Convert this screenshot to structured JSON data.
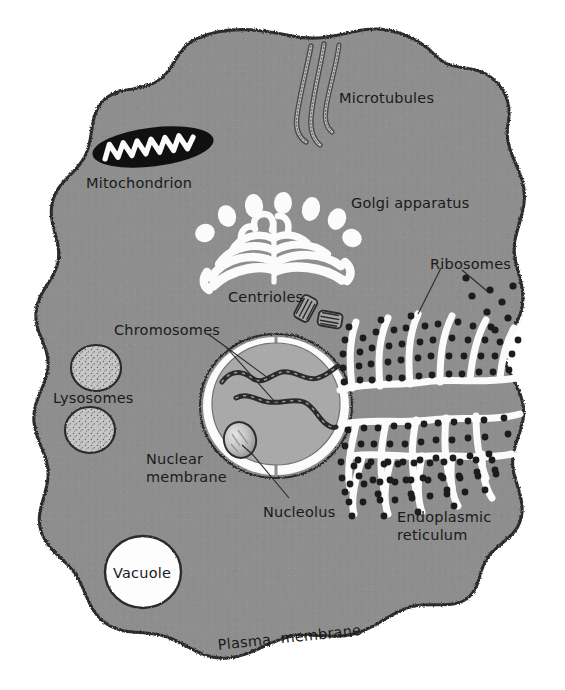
{
  "diagram": {
    "type": "labeled-biological-diagram",
    "canvas": {
      "width": 565,
      "height": 690
    },
    "colors": {
      "background": "#ffffff",
      "cytoplasm": "#8e8e8e",
      "cytoplasm_shade": "#9a9a9a",
      "membrane_outline": "#2b2b2b",
      "organelle_white": "#fbfbfb",
      "nucleoplasm": "#a9a9a9",
      "nucleolus": "#c8c8c8",
      "lysosome_fill": "#c4c4c4",
      "mitochondrion_fill": "#111111",
      "ribosome_dot": "#1c1c1c",
      "label_text": "#1a1a1a"
    },
    "labels": [
      {
        "id": "microtubules",
        "text": "Microtubules",
        "x": 339,
        "y": 90,
        "rotate": 0
      },
      {
        "id": "mitochondrion",
        "text": "Mitochondrion",
        "x": 86,
        "y": 175,
        "rotate": 0
      },
      {
        "id": "golgi",
        "text": "Golgi apparatus",
        "x": 351,
        "y": 195,
        "rotate": 0
      },
      {
        "id": "ribosomes",
        "text": "Ribosomes",
        "x": 430,
        "y": 256,
        "rotate": 0
      },
      {
        "id": "centrioles",
        "text": "Centrioles",
        "x": 228,
        "y": 289,
        "rotate": 0
      },
      {
        "id": "chromosomes",
        "text": "Chromosomes",
        "x": 114,
        "y": 322,
        "rotate": 0
      },
      {
        "id": "lysosomes",
        "text": "Lysosomes",
        "x": 53,
        "y": 390,
        "rotate": 0
      },
      {
        "id": "nuclear-membrane",
        "text": "Nuclear\nmembrane",
        "x": 146,
        "y": 450,
        "rotate": 0
      },
      {
        "id": "nucleolus",
        "text": "Nucleolus",
        "x": 263,
        "y": 504,
        "rotate": 0
      },
      {
        "id": "endoplasmic-reticulum",
        "text": "Endoplasmic\nreticulum",
        "x": 397,
        "y": 508,
        "rotate": 0
      },
      {
        "id": "vacuole",
        "text": "Vacuole",
        "x": 113,
        "y": 565,
        "rotate": 0
      },
      {
        "id": "plasma-membrane",
        "text": "Plasma  membrane",
        "x": 217,
        "y": 637,
        "rotate": -6
      }
    ],
    "organelles": [
      {
        "id": "plasma-membrane",
        "name": "Plasma membrane",
        "count": 1,
        "appearance": "irregular amoeboid outline with stippled dark border enclosing gray cytoplasm"
      },
      {
        "id": "cytoplasm",
        "name": "Cytoplasm",
        "count": 1,
        "appearance": "medium gray textured fill"
      },
      {
        "id": "mitochondrion",
        "name": "Mitochondrion",
        "count": 1,
        "appearance": "black elongated ellipse with white zigzag cristae"
      },
      {
        "id": "microtubules",
        "name": "Microtubules",
        "count": 3,
        "appearance": "three wavy vertical tubes, light fill with dark outline"
      },
      {
        "id": "golgi-apparatus",
        "name": "Golgi apparatus",
        "count": 1,
        "appearance": "white stacked curved cisternae with detached vesicles above"
      },
      {
        "id": "centrioles",
        "name": "Centrioles",
        "count": 2,
        "appearance": "two short striated cylinders at right angles"
      },
      {
        "id": "nucleus",
        "name": "Nucleus",
        "count": 1,
        "appearance": "large light gray sphere ringed by white nuclear membrane"
      },
      {
        "id": "nuclear-membrane",
        "name": "Nuclear membrane",
        "count": 1,
        "appearance": "white double-layer ring around the nucleus"
      },
      {
        "id": "nucleolus",
        "name": "Nucleolus",
        "count": 1,
        "appearance": "small light speckled sphere inside the nucleus"
      },
      {
        "id": "chromosomes",
        "name": "Chromosomes",
        "count": 2,
        "appearance": "two dark wavy threads inside the nucleus"
      },
      {
        "id": "endoplasmic-reticulum",
        "name": "Endoplasmic reticulum",
        "count": 1,
        "appearance": "network of white branching channels to the right of nucleus"
      },
      {
        "id": "ribosomes",
        "name": "Ribosomes",
        "count": 0,
        "appearance": "small black dots studding the ER and scattered free in cytoplasm"
      },
      {
        "id": "lysosomes",
        "name": "Lysosomes",
        "count": 2,
        "appearance": "two light gray speckled round bodies"
      },
      {
        "id": "vacuole",
        "name": "Vacuole",
        "count": 1,
        "appearance": "large plain white circle"
      }
    ]
  }
}
